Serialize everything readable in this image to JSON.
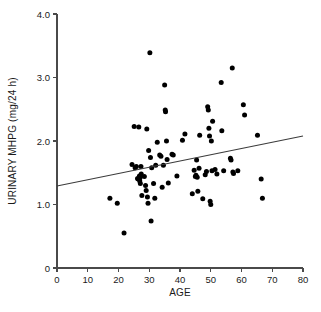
{
  "chart_data": {
    "type": "scatter",
    "title": "",
    "xlabel": "AGE",
    "ylabel": "URINARY MHPG (mg/24 h)",
    "xlim": [
      0,
      80
    ],
    "ylim": [
      0,
      4.0
    ],
    "xticks": [
      0,
      10,
      20,
      30,
      40,
      50,
      60,
      70,
      80
    ],
    "xtick_labels": [
      "0",
      "10",
      "20",
      "30",
      "40",
      "50",
      "60",
      "70",
      "80"
    ],
    "yticks": [
      0,
      1.0,
      2.0,
      3.0,
      4.0
    ],
    "ytick_labels": [
      "0",
      "1.0",
      "2.0",
      "3.0",
      "4.0"
    ],
    "grid": false,
    "legend": null,
    "marker": "filled-circle",
    "marker_color": "#000000",
    "point_count": 84,
    "points": [
      [
        17.2,
        1.1
      ],
      [
        19.6,
        1.02
      ],
      [
        21.8,
        0.55
      ],
      [
        24.4,
        1.63
      ],
      [
        25.1,
        2.23
      ],
      [
        25.4,
        1.58
      ],
      [
        25.8,
        1.6
      ],
      [
        26.2,
        1.41
      ],
      [
        26.4,
        1.4
      ],
      [
        26.6,
        2.22
      ],
      [
        26.8,
        1.45
      ],
      [
        26.9,
        1.37
      ],
      [
        27.0,
        1.42
      ],
      [
        27.1,
        1.33
      ],
      [
        27.3,
        1.6
      ],
      [
        27.4,
        1.48
      ],
      [
        27.6,
        1.14
      ],
      [
        28.4,
        1.44
      ],
      [
        28.8,
        1.3
      ],
      [
        29.0,
        1.22
      ],
      [
        29.2,
        2.19
      ],
      [
        29.4,
        1.12
      ],
      [
        29.6,
        1.02
      ],
      [
        29.8,
        1.85
      ],
      [
        30.2,
        3.39
      ],
      [
        30.4,
        1.74
      ],
      [
        30.6,
        0.74
      ],
      [
        30.8,
        1.58
      ],
      [
        31.4,
        1.33
      ],
      [
        31.8,
        1.1
      ],
      [
        32.1,
        1.62
      ],
      [
        32.6,
        1.98
      ],
      [
        33.4,
        1.78
      ],
      [
        33.8,
        1.76
      ],
      [
        34.2,
        1.27
      ],
      [
        34.6,
        1.62
      ],
      [
        35.0,
        2.88
      ],
      [
        35.2,
        2.49
      ],
      [
        35.3,
        2.46
      ],
      [
        35.6,
        2.0
      ],
      [
        35.8,
        1.71
      ],
      [
        36.2,
        1.34
      ],
      [
        37.4,
        1.79
      ],
      [
        37.8,
        1.78
      ],
      [
        39.0,
        1.45
      ],
      [
        40.8,
        2.01
      ],
      [
        41.6,
        2.11
      ],
      [
        44.0,
        1.17
      ],
      [
        44.6,
        1.54
      ],
      [
        45.0,
        1.44
      ],
      [
        45.2,
        1.46
      ],
      [
        45.4,
        1.7
      ],
      [
        45.6,
        1.43
      ],
      [
        45.8,
        1.21
      ],
      [
        46.2,
        1.57
      ],
      [
        46.4,
        2.09
      ],
      [
        47.4,
        1.09
      ],
      [
        48.2,
        1.47
      ],
      [
        48.6,
        1.52
      ],
      [
        49.0,
        2.54
      ],
      [
        49.2,
        2.49
      ],
      [
        49.4,
        2.2
      ],
      [
        49.6,
        2.08
      ],
      [
        49.8,
        1.05
      ],
      [
        50.0,
        1.0
      ],
      [
        50.4,
        1.53
      ],
      [
        50.6,
        2.31
      ],
      [
        51.4,
        1.55
      ],
      [
        52.0,
        1.48
      ],
      [
        53.4,
        2.92
      ],
      [
        53.6,
        2.16
      ],
      [
        54.2,
        1.53
      ],
      [
        56.4,
        1.73
      ],
      [
        56.6,
        1.7
      ],
      [
        57.0,
        3.15
      ],
      [
        57.2,
        1.51
      ],
      [
        57.4,
        1.49
      ],
      [
        58.8,
        1.53
      ],
      [
        60.6,
        2.57
      ],
      [
        61.0,
        2.41
      ],
      [
        65.2,
        2.09
      ],
      [
        66.4,
        1.4
      ],
      [
        66.8,
        1.1
      ],
      [
        50.2,
        2.0
      ]
    ],
    "fit_line": {
      "type": "linear-regression",
      "x_start": 0,
      "y_start": 1.29,
      "x_end": 80,
      "y_end": 2.08
    }
  }
}
